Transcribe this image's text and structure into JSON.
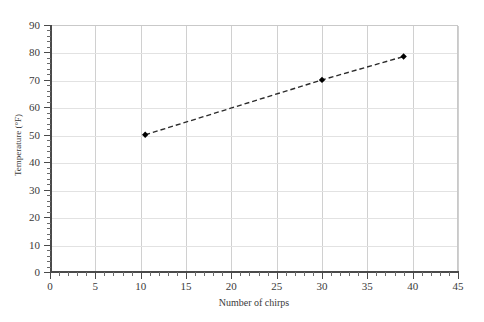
{
  "chart_data": {
    "type": "scatter",
    "title": "",
    "xlabel": "Number of chirps",
    "ylabel": "Temperature (°F)",
    "xlim": [
      0,
      45
    ],
    "ylim": [
      0,
      90
    ],
    "x_major_step": 5,
    "x_minor_step": 1,
    "y_major_step": 10,
    "y_minor_step": 2,
    "x_ticks": [
      "0",
      "5",
      "10",
      "15",
      "20",
      "25",
      "30",
      "35",
      "40",
      "45"
    ],
    "y_ticks": [
      "0",
      "10",
      "20",
      "30",
      "40",
      "50",
      "60",
      "70",
      "80",
      "90"
    ],
    "grid": true,
    "legend": "none",
    "series": [
      {
        "name": "chirps vs temperature",
        "marker": "diamond",
        "marker_color": "#000000",
        "line_style": "dashed",
        "line_color": "#2b2b2b",
        "points": [
          {
            "x": 10.5,
            "y": 50
          },
          {
            "x": 30,
            "y": 70
          },
          {
            "x": 39,
            "y": 78.5
          }
        ]
      }
    ]
  },
  "colors": {
    "grid_vertical": "#d0d0d0",
    "grid_horizontal": "#e2e2e2",
    "axis": "#4a4a4a",
    "text": "#3a3a3a",
    "background": "#ffffff"
  }
}
